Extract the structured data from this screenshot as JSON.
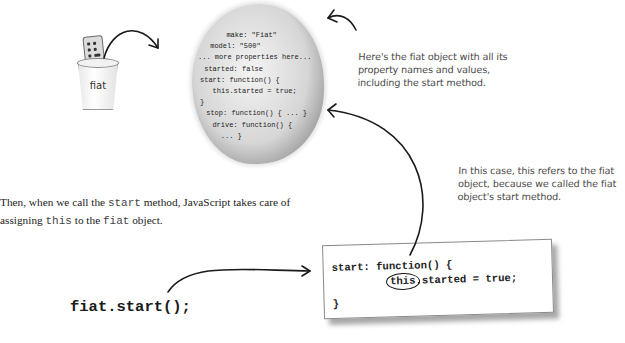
{
  "object_bubble": {
    "lines": [
      "  make: \"Fiat\"",
      " model: \"500\"",
      "... more properties here...",
      " started: false",
      "start: function() {",
      "   this.started = true;",
      "}",
      " stop: function() { ... }",
      "  drive: function() {",
      "    ... }"
    ]
  },
  "bucket": {
    "label": "fiat",
    "icon": "remote-control-in-cup-icon"
  },
  "notes": {
    "top": "Here's the fiat object with all its property names and values, including the start method.",
    "right": "In this case, this refers to the fiat object, because we called the fiat object's start method."
  },
  "paragraph": {
    "p1": "Then, when we call the ",
    "code1": "start",
    "p2": " method, JavaScript takes care of assigning ",
    "code2": "this",
    "p3": " to the ",
    "code3": "fiat",
    "p4": " object."
  },
  "code_box": {
    "line1": "start: function() {",
    "line2_this": "this",
    "line2_rest": ".started = true;",
    "line3": "}"
  },
  "call_expression": "fiat.start();"
}
